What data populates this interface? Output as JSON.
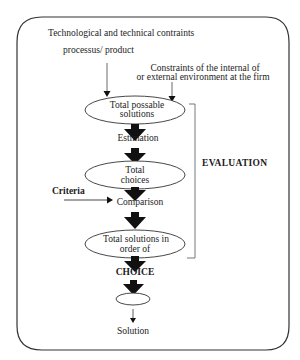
{
  "diagram": {
    "inputs": {
      "tech_constraints": "Technological and technical contraints",
      "tech_sub": "processus/ product",
      "env_constraints_line1": "Constraints of the internal of",
      "env_constraints_line2": "or  external environment at the firm",
      "criteria": "Criteria"
    },
    "nodes": [
      {
        "id": "total-possible-solutions",
        "line1": "Total  possable",
        "line2": "solutions",
        "shape": "ellipse"
      },
      {
        "id": "total-choices",
        "line1": "Total",
        "line2": "choices",
        "shape": "ellipse"
      },
      {
        "id": "total-solutions-in-order",
        "line1": "Total solutions in",
        "line2": "order of",
        "shape": "ellipse"
      },
      {
        "id": "final-choice",
        "line1": "",
        "line2": "",
        "shape": "ellipse-small"
      }
    ],
    "steps": {
      "estimation": "Estimation",
      "comparison": "Comparison",
      "choice": "CHOICE",
      "solution": "Solution"
    },
    "bracket_label": "EVALUATION",
    "colors": {
      "line": "#222222",
      "arrow": "#111111",
      "background": "#ffffff"
    }
  }
}
